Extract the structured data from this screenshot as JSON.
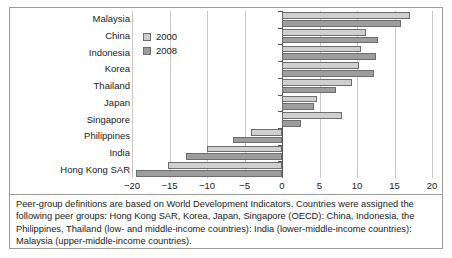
{
  "legend": {
    "entries": [
      {
        "label": "2000",
        "color": "#cfcfcf",
        "name": "series-2000"
      },
      {
        "label": "2008",
        "color": "#9d9d9d",
        "name": "series-2008"
      }
    ]
  },
  "footnote": {
    "text": "Peer-group definitions are based on World Development Indicators. Countries were assigned the following peer groups: Hong Kong SAR, Korea, Japan, Singapore (OECD): China, Indonesia, the Philippines, Thailand (low- and middle-income countries): India (lower-middle-income countries): Malaysia (upper-middle-income countries)."
  },
  "chart_data": {
    "type": "bar",
    "orientation": "horizontal",
    "title": "",
    "xlabel": "",
    "ylabel": "",
    "xlim": [
      -20,
      20
    ],
    "xticks": [
      -20,
      -15,
      -10,
      -5,
      0,
      5,
      10,
      15,
      20
    ],
    "xtick_labels": [
      "−20",
      "−15",
      "−10",
      "−5",
      "0",
      "5",
      "10",
      "15",
      "20"
    ],
    "grid": true,
    "legend_position": "upper-left-inside",
    "categories": [
      "Malaysia",
      "China",
      "Indonesia",
      "Korea",
      "Thailand",
      "Japan",
      "Singapore",
      "Philippines",
      "India",
      "Hong Kong SAR"
    ],
    "series": [
      {
        "name": "2000",
        "color": "#cfcfcf",
        "values": [
          17.0,
          11.2,
          10.5,
          10.3,
          9.3,
          4.7,
          8.0,
          -4.2,
          -10.0,
          -15.2
        ]
      },
      {
        "name": "2008",
        "color": "#9d9d9d",
        "values": [
          15.8,
          12.8,
          12.5,
          12.3,
          7.2,
          4.2,
          2.5,
          -6.5,
          -12.8,
          -19.5
        ]
      }
    ]
  }
}
